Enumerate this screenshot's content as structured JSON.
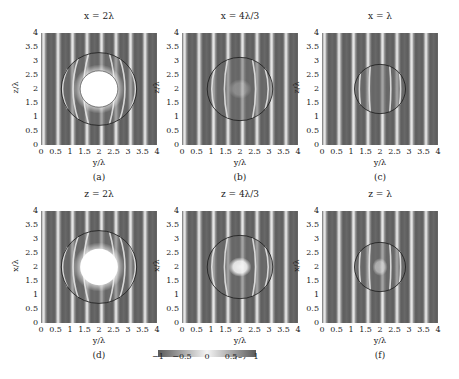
{
  "figure": {
    "colorbar": {
      "ticks": [
        "−1",
        "−0.5",
        "0",
        "0.5",
        "1"
      ],
      "range": [
        -1,
        1
      ],
      "colors": {
        "low": "#555555",
        "mid": "#ffffff",
        "high": "#555555"
      }
    },
    "panels": [
      {
        "title": "x = 2λ",
        "caption": "(a)",
        "xlabel": "y/λ",
        "ylabel": "z/λ"
      },
      {
        "title": "x = 4λ/3",
        "caption": "(b)",
        "xlabel": "y/λ",
        "ylabel": "z/λ"
      },
      {
        "title": "x = λ",
        "caption": "(c)",
        "xlabel": "y/λ",
        "ylabel": "z/λ"
      },
      {
        "title": "z = 2λ",
        "caption": "(d)",
        "xlabel": "y/λ",
        "ylabel": "x/λ"
      },
      {
        "title": "z = 4λ/3",
        "caption": "(e)",
        "xlabel": "y/λ",
        "ylabel": "x/λ"
      },
      {
        "title": "z = λ",
        "caption": "(f)",
        "xlabel": "y/λ",
        "ylabel": "x/λ"
      }
    ],
    "ticks": [
      "0",
      "0.5",
      "1",
      "1.5",
      "2",
      "2.5",
      "3",
      "3.5",
      "4"
    ]
  },
  "chart_data": [
    {
      "type": "heatmap",
      "title": "x = 2λ",
      "caption": "(a)",
      "xlabel": "y/λ",
      "ylabel": "z/λ",
      "xlim": [
        0,
        4
      ],
      "ylim": [
        0,
        4
      ],
      "xticks": [
        0,
        0.5,
        1,
        1.5,
        2,
        2.5,
        3,
        3.5,
        4
      ],
      "yticks": [
        0,
        0.5,
        1,
        1.5,
        2,
        2.5,
        3,
        3.5,
        4
      ],
      "colorbar_range": [
        -1,
        1
      ],
      "stripe_period": 0.5,
      "sphere_outline": {
        "center": [
          2,
          2
        ],
        "radius": 1.3
      },
      "bright_core": {
        "center": [
          2,
          2
        ],
        "radius": 0.65
      }
    },
    {
      "type": "heatmap",
      "title": "x = 4λ/3",
      "caption": "(b)",
      "xlabel": "y/λ",
      "ylabel": "z/λ",
      "xlim": [
        0,
        4
      ],
      "ylim": [
        0,
        4
      ],
      "xticks": [
        0,
        0.5,
        1,
        1.5,
        2,
        2.5,
        3,
        3.5,
        4
      ],
      "yticks": [
        0,
        0.5,
        1,
        1.5,
        2,
        2.5,
        3,
        3.5,
        4
      ],
      "colorbar_range": [
        -1,
        1
      ],
      "stripe_period": 0.5,
      "sphere_outline": {
        "center": [
          2,
          2
        ],
        "radius": 1.13
      }
    },
    {
      "type": "heatmap",
      "title": "x = λ",
      "caption": "(c)",
      "xlabel": "y/λ",
      "ylabel": "z/λ",
      "xlim": [
        0,
        4
      ],
      "ylim": [
        0,
        4
      ],
      "xticks": [
        0,
        0.5,
        1,
        1.5,
        2,
        2.5,
        3,
        3.5,
        4
      ],
      "yticks": [
        0,
        0.5,
        1,
        1.5,
        2,
        2.5,
        3,
        3.5,
        4
      ],
      "colorbar_range": [
        -1,
        1
      ],
      "stripe_period": 0.5,
      "sphere_outline": {
        "center": [
          2,
          2
        ],
        "radius": 0.88
      }
    },
    {
      "type": "heatmap",
      "title": "z = 2λ",
      "caption": "(d)",
      "xlabel": "y/λ",
      "ylabel": "x/λ",
      "xlim": [
        0,
        4
      ],
      "ylim": [
        0,
        4
      ],
      "xticks": [
        0,
        0.5,
        1,
        1.5,
        2,
        2.5,
        3,
        3.5,
        4
      ],
      "yticks": [
        0,
        0.5,
        1,
        1.5,
        2,
        2.5,
        3,
        3.5,
        4
      ],
      "colorbar_range": [
        -1,
        1
      ],
      "stripe_period": 0.5,
      "sphere_outline": {
        "center": [
          2,
          2
        ],
        "radius": 1.3
      },
      "bright_core": {
        "center": [
          2,
          2
        ],
        "radius": 0.65
      }
    },
    {
      "type": "heatmap",
      "title": "z = 4λ/3",
      "caption": "(e)",
      "xlabel": "y/λ",
      "ylabel": "x/λ",
      "xlim": [
        0,
        4
      ],
      "ylim": [
        0,
        4
      ],
      "xticks": [
        0,
        0.5,
        1,
        1.5,
        2,
        2.5,
        3,
        3.5,
        4
      ],
      "yticks": [
        0,
        0.5,
        1,
        1.5,
        2,
        2.5,
        3,
        3.5,
        4
      ],
      "colorbar_range": [
        -1,
        1
      ],
      "stripe_period": 0.5,
      "sphere_outline": {
        "center": [
          2,
          2
        ],
        "radius": 1.13
      }
    },
    {
      "type": "heatmap",
      "title": "z = λ",
      "caption": "(f)",
      "xlabel": "y/λ",
      "ylabel": "x/λ",
      "xlim": [
        0,
        4
      ],
      "ylim": [
        0,
        4
      ],
      "xticks": [
        0,
        0.5,
        1,
        1.5,
        2,
        2.5,
        3,
        3.5,
        4
      ],
      "yticks": [
        0,
        0.5,
        1,
        1.5,
        2,
        2.5,
        3,
        3.5,
        4
      ],
      "colorbar_range": [
        -1,
        1
      ],
      "stripe_period": 0.5,
      "sphere_outline": {
        "center": [
          2,
          2
        ],
        "radius": 0.88
      }
    }
  ]
}
